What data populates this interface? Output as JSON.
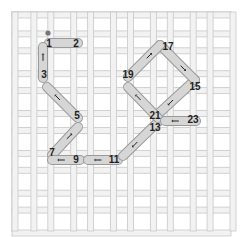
{
  "diagram": {
    "type": "needlepoint-stitch-diagram",
    "grid": {
      "columns": 11,
      "rows": 11,
      "origin": [
        12,
        12
      ],
      "size": [
        219,
        219
      ],
      "bar_color": "#f2f2f2",
      "bar_edge_color": "#c8c8c8"
    },
    "stitch_color": "#d6d6d6",
    "stitch_edge_color": "#9a9a9a",
    "start_dot": {
      "x": 48,
      "y": 33,
      "color": "#777777"
    },
    "labels": [
      {
        "text": "1",
        "x": 49,
        "y": 47
      },
      {
        "text": "2",
        "x": 76,
        "y": 47
      },
      {
        "text": "3",
        "x": 44,
        "y": 78
      },
      {
        "text": "5",
        "x": 77,
        "y": 119
      },
      {
        "text": "7",
        "x": 52,
        "y": 156
      },
      {
        "text": "9",
        "x": 76,
        "y": 163
      },
      {
        "text": "11",
        "x": 114,
        "y": 163
      },
      {
        "text": "13",
        "x": 155,
        "y": 131
      },
      {
        "text": "15",
        "x": 195,
        "y": 90
      },
      {
        "text": "17",
        "x": 168,
        "y": 50
      },
      {
        "text": "19",
        "x": 128,
        "y": 78
      },
      {
        "text": "21",
        "x": 155,
        "y": 119
      },
      {
        "text": "23",
        "x": 193,
        "y": 123
      }
    ],
    "stitches": [
      {
        "from": [
          49,
          43
        ],
        "to": [
          78,
          43
        ],
        "arrow": "none"
      },
      {
        "from": [
          43,
          47
        ],
        "to": [
          43,
          78
        ],
        "arrow": "up"
      },
      {
        "from": [
          47,
          87
        ],
        "to": [
          78,
          118
        ],
        "arrow": "up-left"
      },
      {
        "from": [
          78,
          127
        ],
        "to": [
          52,
          155
        ],
        "arrow": "up-right"
      },
      {
        "from": [
          52,
          160
        ],
        "to": [
          80,
          160
        ],
        "arrow": "left"
      },
      {
        "from": [
          88,
          160
        ],
        "to": [
          118,
          160
        ],
        "arrow": "left"
      },
      {
        "from": [
          123,
          156
        ],
        "to": [
          158,
          122
        ],
        "arrow": "down-left"
      },
      {
        "from": [
          158,
          114
        ],
        "to": [
          195,
          80
        ],
        "arrow": "down-left"
      },
      {
        "from": [
          195,
          80
        ],
        "to": [
          160,
          45
        ],
        "arrow": "down-right"
      },
      {
        "from": [
          160,
          45
        ],
        "to": [
          128,
          77
        ],
        "arrow": "up-right"
      },
      {
        "from": [
          128,
          87
        ],
        "to": [
          158,
          118
        ],
        "arrow": "up-left"
      },
      {
        "from": [
          165,
          121
        ],
        "to": [
          196,
          121
        ],
        "arrow": "left"
      }
    ]
  }
}
